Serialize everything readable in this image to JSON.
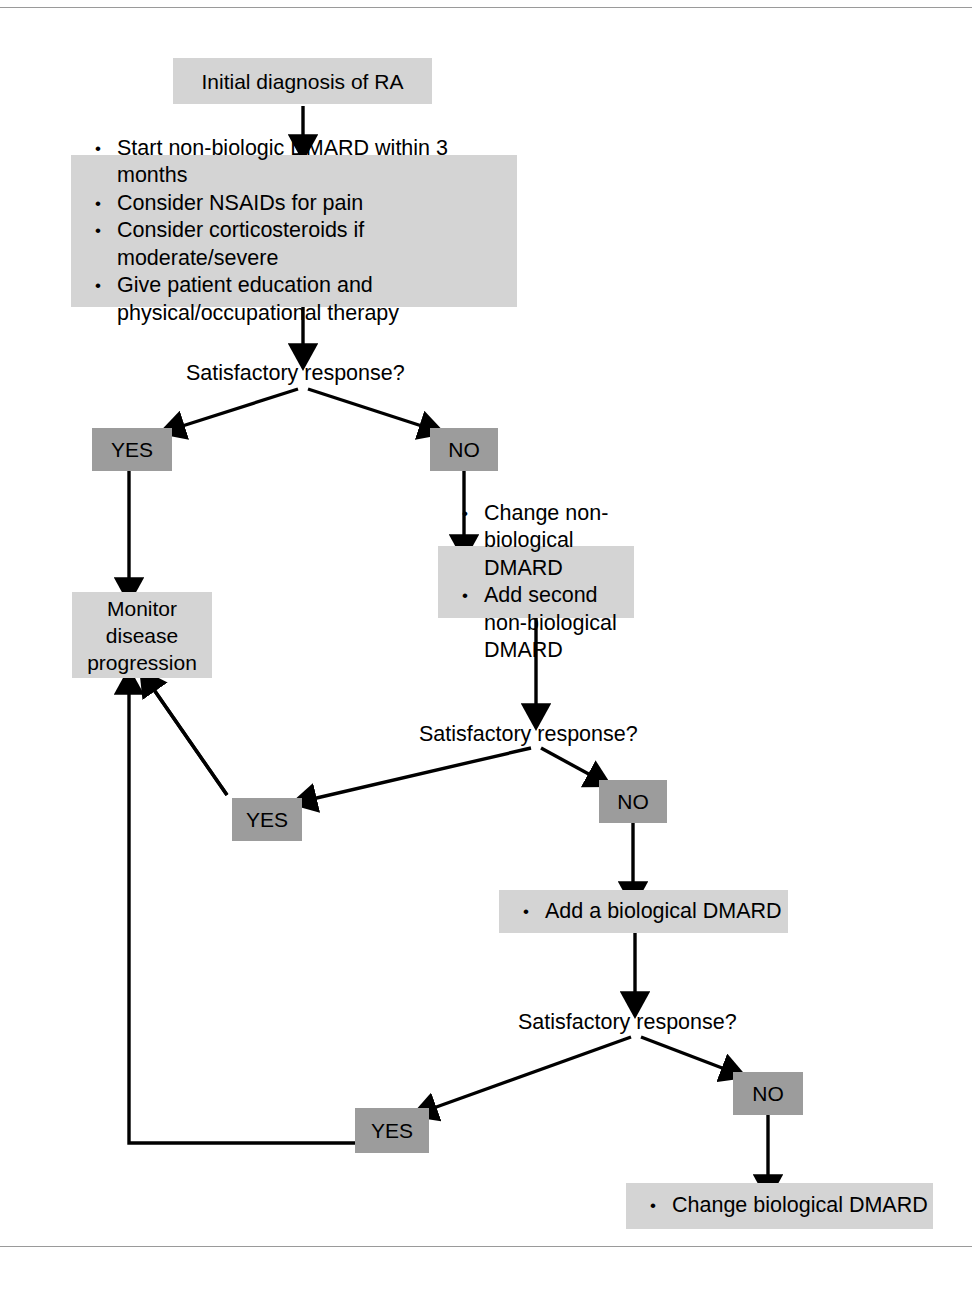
{
  "figure": {
    "type": "flowchart",
    "colors": {
      "process_box": "#d4d4d4",
      "decision_chip": "#9c9c9c",
      "connector": "#000000",
      "frame_rule": "#9a9a9a",
      "background": "#ffffff",
      "text": "#000000"
    }
  },
  "nodes": {
    "initial_diagnosis": {
      "text": "Initial diagnosis of RA"
    },
    "first_line_treatment": {
      "bullets": [
        "Start non-biologic DMARD within 3 months",
        "Consider NSAIDs for pain",
        "Consider corticosteroids if moderate/severe",
        "Give patient education and\nphysical/occupational therapy"
      ]
    },
    "decision_1": {
      "text": "Satisfactory response?"
    },
    "decision_1_yes": {
      "text": "YES"
    },
    "decision_1_no": {
      "text": "NO"
    },
    "monitor": {
      "text": "Monitor\ndisease\nprogression"
    },
    "second_line_treatment": {
      "bullets": [
        "Change non-biological DMARD",
        "Add second non-biological DMARD"
      ]
    },
    "decision_2": {
      "text": "Satisfactory response?"
    },
    "decision_2_yes": {
      "text": "YES"
    },
    "decision_2_no": {
      "text": "NO"
    },
    "add_biological": {
      "bullets": [
        "Add a biological DMARD"
      ]
    },
    "decision_3": {
      "text": "Satisfactory response?"
    },
    "decision_3_yes": {
      "text": "YES"
    },
    "decision_3_no": {
      "text": "NO"
    },
    "change_biological": {
      "bullets": [
        "Change biological DMARD"
      ]
    }
  },
  "edges": [
    {
      "from": "initial_diagnosis",
      "to": "first_line_treatment",
      "kind": "arrow"
    },
    {
      "from": "first_line_treatment",
      "to": "decision_1",
      "kind": "arrow"
    },
    {
      "from": "decision_1",
      "to": "decision_1_yes",
      "kind": "arrow"
    },
    {
      "from": "decision_1",
      "to": "decision_1_no",
      "kind": "arrow"
    },
    {
      "from": "decision_1_yes",
      "to": "monitor",
      "kind": "arrow"
    },
    {
      "from": "decision_1_no",
      "to": "second_line_treatment",
      "kind": "arrow"
    },
    {
      "from": "second_line_treatment",
      "to": "decision_2",
      "kind": "arrow"
    },
    {
      "from": "decision_2",
      "to": "decision_2_yes",
      "kind": "arrow"
    },
    {
      "from": "decision_2",
      "to": "decision_2_no",
      "kind": "arrow"
    },
    {
      "from": "decision_2_yes",
      "to": "monitor",
      "kind": "arrow"
    },
    {
      "from": "decision_2_no",
      "to": "add_biological",
      "kind": "arrow"
    },
    {
      "from": "add_biological",
      "to": "decision_3",
      "kind": "arrow"
    },
    {
      "from": "decision_3",
      "to": "decision_3_yes",
      "kind": "arrow"
    },
    {
      "from": "decision_3",
      "to": "decision_3_no",
      "kind": "arrow"
    },
    {
      "from": "decision_3_yes",
      "to": "monitor",
      "kind": "feedback-line"
    },
    {
      "from": "decision_3_no",
      "to": "change_biological",
      "kind": "arrow"
    }
  ]
}
